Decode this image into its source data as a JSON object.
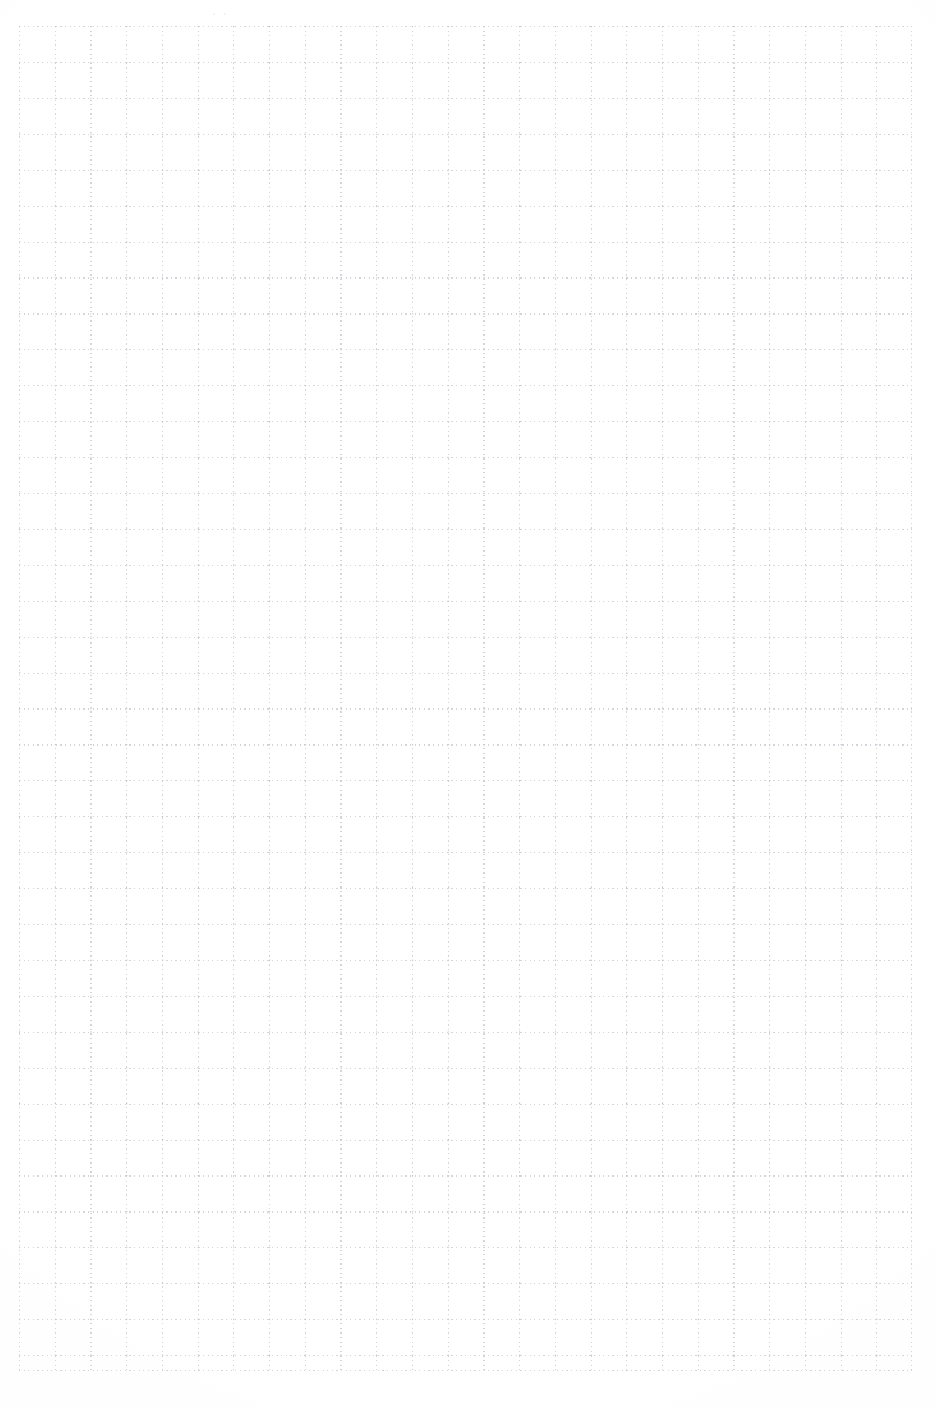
{
  "page": {
    "width": 936,
    "height": 1408,
    "background_color": "#ffffff",
    "paper_type": "dotted graph paper",
    "orientation": "portrait"
  },
  "grid": {
    "name": "dotted-square-grid",
    "line_style": "dotted",
    "dot_color": "#d4d4da",
    "node_color": "#c3c3ca",
    "cell_width_px": 35.72,
    "cell_height_px": 35.92,
    "columns": 25,
    "rows": 37,
    "origin_x_px": 19,
    "origin_y_px": 26,
    "extent_width_px": 893,
    "extent_height_px": 1345,
    "left_margin_px": 19,
    "right_margin_px": 24,
    "top_margin_px": 26,
    "bottom_margin_px": 37
  },
  "artifacts": {
    "top_smudge": {
      "label": "faint-scan-smudge",
      "text": "· ·",
      "color": "#e9e9ee",
      "x_px": 212,
      "y_px": 6
    },
    "bottom_smudge": {
      "label": "faint-scan-speck",
      "text": "·",
      "color": "#ededf1",
      "x_px": 384,
      "y_px": 1366
    }
  },
  "content": {
    "written_text": "",
    "notes": "Blank sheet — no handwriting, printing, or drawings present."
  }
}
